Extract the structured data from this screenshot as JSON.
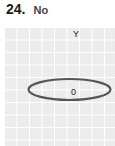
{
  "question": {
    "number": "24.",
    "answer": "No"
  },
  "diagram": {
    "axis_label": "Y",
    "point_label": "0",
    "shape": "ellipse",
    "stroke_color": "#555555",
    "grid_color": "#ececec"
  }
}
